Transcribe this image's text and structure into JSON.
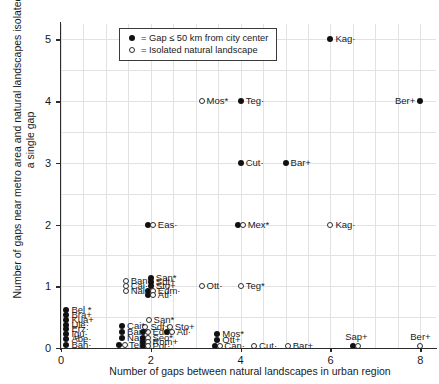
{
  "chart_data": {
    "type": "scatter",
    "title": "",
    "xlabel": "Number of gaps between natural landscapes in urban region",
    "ylabel": "Number of gaps near metro area and natural landscapes isolated by a single gap",
    "xlim": [
      0,
      8.35
    ],
    "ylim": [
      0,
      5.25
    ],
    "xticks": [
      0,
      2,
      4,
      6,
      8
    ],
    "yticks": [
      0,
      1,
      2,
      3,
      4,
      5
    ],
    "grid": true,
    "legend_position": "top-left-inside",
    "legend": [
      {
        "marker": "filled",
        "label": "= Gap ≤ 50 km from city center"
      },
      {
        "marker": "open",
        "label": "= Isolated natural landscape"
      }
    ],
    "series": [
      {
        "name": "Gap ≤ 50 km from city center",
        "marker": "filled"
      },
      {
        "name": "Isolated natural landscape",
        "marker": "open"
      }
    ],
    "points": [
      {
        "label": "Kag·",
        "x": 6.0,
        "y": 5.0,
        "marker": "filled",
        "side": "right"
      },
      {
        "label": "Ber+",
        "x": 8.0,
        "y": 4.0,
        "marker": "filled",
        "side": "left"
      },
      {
        "label": "Mos*",
        "x": 3.13,
        "y": 4.0,
        "marker": "open",
        "side": "right"
      },
      {
        "label": "Teg·",
        "x": 4.0,
        "y": 4.0,
        "marker": "filled",
        "side": "right"
      },
      {
        "label": "Cut·",
        "x": 4.0,
        "y": 3.0,
        "marker": "filled",
        "side": "right"
      },
      {
        "label": "Bar+",
        "x": 5.0,
        "y": 3.0,
        "marker": "filled",
        "side": "right"
      },
      {
        "label": "Eas·",
        "x": 2.0,
        "y": 2.0,
        "marker": "both",
        "side": "right"
      },
      {
        "label": "Mex*",
        "x": 4.0,
        "y": 2.0,
        "marker": "both",
        "side": "right"
      },
      {
        "label": "Kag·",
        "x": 6.0,
        "y": 2.0,
        "marker": "open",
        "side": "right"
      },
      {
        "label": "Ban*",
        "x": 1.44,
        "y": 1.08,
        "marker": "open",
        "side": "right"
      },
      {
        "label": "Cai·",
        "x": 1.44,
        "y": 1.0,
        "marker": "open",
        "side": "right"
      },
      {
        "label": "Nai+",
        "x": 1.44,
        "y": 0.92,
        "marker": "open",
        "side": "right"
      },
      {
        "label": "San*",
        "x": 2.0,
        "y": 1.14,
        "marker": "filled",
        "side": "right"
      },
      {
        "label": "Sdt+",
        "x": 2.0,
        "y": 1.07,
        "marker": "filled",
        "side": "right"
      },
      {
        "label": "Sto+",
        "x": 2.0,
        "y": 1.0,
        "marker": "filled",
        "side": "right"
      },
      {
        "label": "Edm·",
        "x": 2.0,
        "y": 0.93,
        "marker": "both",
        "side": "right"
      },
      {
        "label": "Atl·",
        "x": 2.0,
        "y": 0.86,
        "marker": "both",
        "side": "right"
      },
      {
        "label": "Ott·",
        "x": 3.13,
        "y": 1.0,
        "marker": "open",
        "side": "right"
      },
      {
        "label": "Teg*",
        "x": 4.0,
        "y": 1.0,
        "marker": "open",
        "side": "right"
      },
      {
        "label": "Bel *",
        "x": 0.12,
        "y": 0.62,
        "marker": "filled",
        "side": "right"
      },
      {
        "label": "Bra+",
        "x": 0.12,
        "y": 0.54,
        "marker": "filled",
        "side": "right"
      },
      {
        "label": "Kua+",
        "x": 0.12,
        "y": 0.46,
        "marker": "filled",
        "side": "right"
      },
      {
        "label": "Ule·",
        "x": 0.12,
        "y": 0.38,
        "marker": "filled",
        "side": "right"
      },
      {
        "label": "Erz·",
        "x": 0.12,
        "y": 0.3,
        "marker": "filled",
        "side": "right"
      },
      {
        "label": "Igu·",
        "x": 0.12,
        "y": 0.22,
        "marker": "filled",
        "side": "right"
      },
      {
        "label": "Abe·",
        "x": 0.12,
        "y": 0.14,
        "marker": "filled",
        "side": "right"
      },
      {
        "label": "Bah·",
        "x": 0.12,
        "y": 0.05,
        "marker": "filled",
        "side": "right"
      },
      {
        "label": "San*",
        "x": 1.95,
        "y": 0.45,
        "marker": "open",
        "side": "right"
      },
      {
        "label": "Sdf+",
        "x": 1.88,
        "y": 0.34,
        "marker": "open",
        "side": "right"
      },
      {
        "label": "Sto+",
        "x": 2.42,
        "y": 0.34,
        "marker": "open",
        "side": "right"
      },
      {
        "label": "Edm·",
        "x": 1.88,
        "y": 0.26,
        "marker": "both",
        "side": "right"
      },
      {
        "label": "Atl·",
        "x": 2.42,
        "y": 0.26,
        "marker": "both",
        "side": "right"
      },
      {
        "label": "Cai*",
        "x": 1.36,
        "y": 0.36,
        "marker": "filled",
        "side": "right"
      },
      {
        "label": "Ban*",
        "x": 1.36,
        "y": 0.26,
        "marker": "filled",
        "side": "right"
      },
      {
        "label": "Nai+",
        "x": 1.36,
        "y": 0.16,
        "marker": "filled",
        "side": "right"
      },
      {
        "label": "Teh *",
        "x": 1.36,
        "y": 0.05,
        "marker": "both",
        "side": "right"
      },
      {
        "label": "Seo*",
        "x": 1.88,
        "y": 0.17,
        "marker": "both",
        "side": "right"
      },
      {
        "label": "Rom+",
        "x": 1.88,
        "y": 0.1,
        "marker": "both",
        "side": "right"
      },
      {
        "label": "Por·",
        "x": 1.88,
        "y": 0.04,
        "marker": "both",
        "side": "right"
      },
      {
        "label": "Mos*",
        "x": 3.48,
        "y": 0.22,
        "marker": "filled",
        "side": "right"
      },
      {
        "label": "Ott+",
        "x": 3.48,
        "y": 0.13,
        "marker": "filled",
        "side": "right"
      },
      {
        "label": "Can·",
        "x": 3.48,
        "y": 0.04,
        "marker": "both",
        "side": "right"
      },
      {
        "label": "Cut·",
        "x": 4.3,
        "y": 0.04,
        "marker": "open",
        "side": "right"
      },
      {
        "label": "Bar+",
        "x": 5.05,
        "y": 0.04,
        "marker": "open",
        "side": "right"
      },
      {
        "label": "Sap+",
        "x": 6.55,
        "y": 0.04,
        "marker": "both",
        "side": "above"
      },
      {
        "label": "Ber+",
        "x": 8.0,
        "y": 0.04,
        "marker": "open",
        "side": "above"
      }
    ]
  },
  "axis": {
    "xlabel": "Number of gaps between natural landscapes in urban region",
    "ylabel": "Number of gaps near metro area and natural landscapes isolated by a single gap",
    "xticklabels": [
      "0",
      "2",
      "4",
      "6",
      "8"
    ],
    "yticklabels": [
      "0",
      "1",
      "2",
      "3",
      "4",
      "5"
    ]
  },
  "legend": {
    "items": [
      {
        "label": "= Gap ≤ 50 km from city center"
      },
      {
        "label": "= Isolated natural landscape"
      }
    ]
  },
  "colors": {
    "marker_fill": "#111111",
    "marker_stroke": "#2d2d2d",
    "grid": "#e2e2e4",
    "axis": "#2b2b2b",
    "text": "#1a1a1a",
    "background": "#ffffff"
  }
}
